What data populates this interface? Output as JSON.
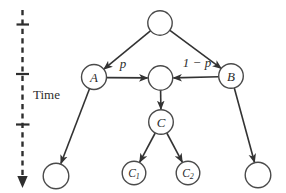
{
  "figure": {
    "time_axis": {
      "label": "Time"
    },
    "nodes": [
      {
        "id": "root",
        "label": ""
      },
      {
        "id": "A",
        "label": "A"
      },
      {
        "id": "mid",
        "label": ""
      },
      {
        "id": "B",
        "label": "B"
      },
      {
        "id": "C",
        "label": "C"
      },
      {
        "id": "C1",
        "label": "C",
        "subscript": "1"
      },
      {
        "id": "C2",
        "label": "C",
        "subscript": "2"
      },
      {
        "id": "leaf-left",
        "label": ""
      },
      {
        "id": "leaf-right",
        "label": ""
      }
    ],
    "edges": [
      {
        "from": "root",
        "to": "A",
        "label": ""
      },
      {
        "from": "root",
        "to": "B",
        "label": ""
      },
      {
        "from": "A",
        "to": "mid",
        "label": "p"
      },
      {
        "from": "B",
        "to": "mid",
        "label": "1 − p"
      },
      {
        "from": "mid",
        "to": "C",
        "label": ""
      },
      {
        "from": "C",
        "to": "C1",
        "label": ""
      },
      {
        "from": "C",
        "to": "C2",
        "label": ""
      },
      {
        "from": "A",
        "to": "leaf-left",
        "label": ""
      },
      {
        "from": "B",
        "to": "leaf-right",
        "label": ""
      }
    ],
    "colors": {
      "edge_stroke": "#333333",
      "node_stroke": "#4a4a4a",
      "node_fill": "#ffffff",
      "text": "#2d2d2d",
      "background": "#ffffff"
    }
  }
}
